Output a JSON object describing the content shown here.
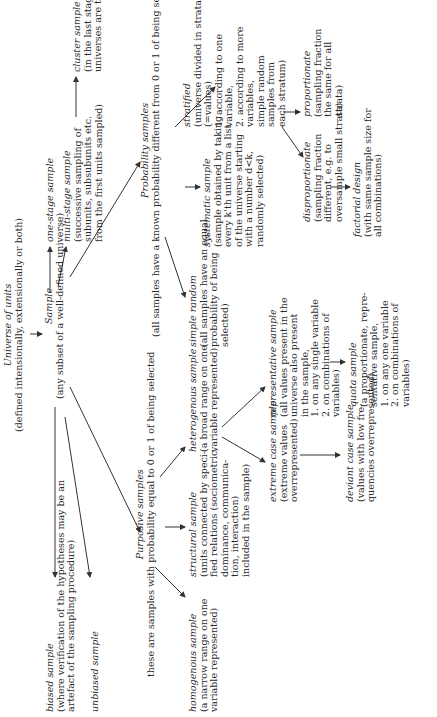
{
  "diagram": {
    "universe": {
      "title": "Universe of units",
      "desc": "(defined intensionally, extensionally or both)"
    },
    "sample": {
      "title": "Sample",
      "desc": "(any subset of a well-defined universe)"
    },
    "one_stage": {
      "title": "one-stage sample"
    },
    "multi_stage": {
      "title": "multi-stage sample",
      "desc": [
        "(successive sampling of",
        "subunits, subsubunits etc.",
        "from the first units sampled)"
      ]
    },
    "cluster": {
      "title": "cluster sample",
      "desc": [
        "(in the last stage the",
        "universes are taken)"
      ]
    },
    "probability": {
      "title": "Probability samples",
      "desc": "(all samples have a known probability different from 0 or 1 of being selected)"
    },
    "simple_random": {
      "title": "simple random",
      "desc": [
        "(all samples have an equal",
        "probability of being",
        "selected)"
      ]
    },
    "systematic": {
      "title": "systematic sample",
      "desc": [
        "(sample obtained by taking",
        "every k'th unit from a list",
        "of the universe starting",
        "with a number d<k,",
        "randomly selected)"
      ]
    },
    "stratified": {
      "title": "stratified",
      "desc": [
        "(universe divided in strata",
        "(=values)",
        "1. according to one",
        "variable,",
        "2. according to more",
        "variables,",
        "simple random",
        "samples from",
        "each stratum)"
      ]
    },
    "proportionate": {
      "title": "proportionate",
      "desc": [
        "(sampling fraction",
        "the same for all",
        "strata)"
      ]
    },
    "disproportionate": {
      "title": "disproportionate",
      "desc": [
        "(sampling fraction",
        "different, e.g. to",
        "oversample small strata)"
      ]
    },
    "factorial": {
      "title": "factorial design",
      "desc": [
        "(with same sample size for",
        "all combinations)"
      ]
    },
    "biased": {
      "title": "biased sample",
      "desc": [
        "(where verification of the hypotheses may be an",
        "artefact of the sampling procedure)"
      ]
    },
    "unbiased": {
      "title": "unbiased sample"
    },
    "purposive": {
      "title": "Purposive samples",
      "desc": "these are samples with probability equal to 0 or 1 of being selected"
    },
    "homogenous": {
      "title": "homogenous sample",
      "desc": [
        "(a narrow range on one",
        "variable represented)"
      ]
    },
    "structural": {
      "title": "structural sample",
      "desc": [
        "(units connected by speci-",
        "fied relations (sociometric,",
        "dominance, communica-",
        "tion, interaction)",
        "included in the sample)"
      ]
    },
    "heterogenous": {
      "title": "heterogenous sample",
      "desc": [
        "(a broad range on one",
        "variable represented)"
      ]
    },
    "representative": {
      "title": "representative sample",
      "desc": [
        "(all values present in the",
        "universe also present",
        "in the sample,",
        "1. on any single variable",
        "2. on combinations of",
        "variables)"
      ]
    },
    "extreme": {
      "title": "extreme case sample",
      "desc": [
        "(extreme values",
        "overrepresented)"
      ]
    },
    "deviant": {
      "title": "deviant case sample",
      "desc": [
        "(values with low fre-",
        "quencies overrepresented)"
      ]
    },
    "quota": {
      "title": "quota sample",
      "desc": [
        "(a proportionate, repre-",
        "sentative sample,",
        "1. on any one variable",
        "2. on combinations of",
        "variables)"
      ]
    }
  }
}
